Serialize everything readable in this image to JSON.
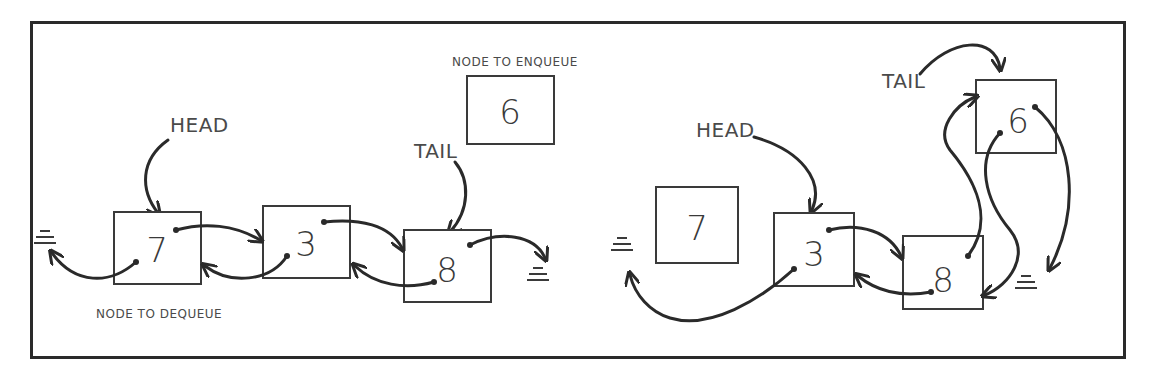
{
  "diagram": {
    "left_panel": {
      "labels": {
        "node_to_enqueue": "NODE TO ENQUEUE",
        "head": "HEAD",
        "tail": "TAIL",
        "node_to_dequeue": "NODE TO DEQUEUE"
      },
      "nodes": [
        {
          "id": "L7",
          "value": "7",
          "role": "head"
        },
        {
          "id": "L3",
          "value": "3",
          "role": "middle"
        },
        {
          "id": "L8",
          "value": "8",
          "role": "tail"
        }
      ],
      "pending_node": {
        "id": "L6",
        "value": "6",
        "role": "node to enqueue"
      },
      "null_terminators": [
        "left of 7 (prev)",
        "right of 8 (next)"
      ]
    },
    "right_panel": {
      "labels": {
        "head": "HEAD",
        "tail": "TAIL"
      },
      "detached_node": {
        "id": "R7",
        "value": "7",
        "role": "dequeued"
      },
      "nodes": [
        {
          "id": "R3",
          "value": "3",
          "role": "head"
        },
        {
          "id": "R8",
          "value": "8",
          "role": "middle"
        },
        {
          "id": "R6",
          "value": "6",
          "role": "tail"
        }
      ],
      "null_terminators": [
        "left of 3 (prev)",
        "right of 6 (next)"
      ]
    }
  }
}
